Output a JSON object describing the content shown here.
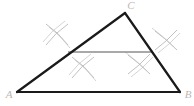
{
  "figure": {
    "canvas": {
      "width": 194,
      "height": 106,
      "background": "#ffffff"
    },
    "colors": {
      "triangle_stroke": "#1a1a1a",
      "midsegment_stroke": "#8c8c8c",
      "arc_stroke": "#b0b0b0",
      "label_fill": "#b9b9b9"
    },
    "stroke_widths": {
      "triangle": 2.2,
      "midsegment": 1.6,
      "arc": 0.8
    },
    "vertices": [
      {
        "name": "A",
        "label": "A",
        "x": 17,
        "y": 92,
        "label_x": 9,
        "label_y": 95
      },
      {
        "name": "B",
        "label": "B",
        "x": 180,
        "y": 92,
        "label_x": 188,
        "label_y": 95
      },
      {
        "name": "C",
        "label": "C",
        "x": 125,
        "y": 13,
        "label_x": 131,
        "label_y": 6
      }
    ],
    "sides": [
      {
        "name": "AB",
        "from": "A",
        "to": "B",
        "x1": 17,
        "y1": 92,
        "x2": 180,
        "y2": 92
      },
      {
        "name": "AC",
        "from": "A",
        "to": "C",
        "x1": 17,
        "y1": 92,
        "x2": 125,
        "y2": 13
      },
      {
        "name": "BC",
        "from": "B",
        "to": "C",
        "x1": 180,
        "y1": 92,
        "x2": 125,
        "y2": 13
      }
    ],
    "midsegment": {
      "name": "midsegment-MN",
      "x1": 68,
      "y1": 52,
      "x2": 152,
      "y2": 52,
      "description": "Horizontal segment joining the midpoint of AC to the midpoint of BC, parallel to AB"
    },
    "midpoints": [
      {
        "name": "M",
        "on_side": "AC",
        "x": 71,
        "y": 52
      },
      {
        "name": "N",
        "on_side": "BC",
        "x": 152,
        "y": 52
      }
    ],
    "arc_groups": [
      {
        "name": "arc-pair-upper-left",
        "side": "AC",
        "position": "above",
        "center_x": 57,
        "center_y": 35,
        "strokes": [
          {
            "x1": 46,
            "y1": 24,
            "x2": 68,
            "y2": 45,
            "curve": 4
          },
          {
            "x1": 68,
            "y1": 24,
            "x2": 46,
            "y2": 45,
            "curve": -4
          }
        ]
      },
      {
        "name": "arc-pair-lower-left",
        "side": "AC",
        "position": "below",
        "center_x": 83,
        "center_y": 68,
        "strokes": [
          {
            "x1": 72,
            "y1": 57,
            "x2": 94,
            "y2": 78,
            "curve": 4
          },
          {
            "x1": 94,
            "y1": 57,
            "x2": 72,
            "y2": 78,
            "curve": -4
          }
        ]
      },
      {
        "name": "arc-pair-upper-right",
        "side": "BC",
        "position": "above",
        "center_x": 166,
        "center_y": 40,
        "strokes": [
          {
            "x1": 155,
            "y1": 50,
            "x2": 177,
            "y2": 30,
            "curve": 4
          },
          {
            "x1": 155,
            "y1": 31,
            "x2": 177,
            "y2": 50,
            "curve": -4
          }
        ]
      },
      {
        "name": "arc-pair-lower-right",
        "side": "BC",
        "position": "below",
        "center_x": 139,
        "center_y": 64,
        "strokes": [
          {
            "x1": 128,
            "y1": 74,
            "x2": 150,
            "y2": 54,
            "curve": 4
          },
          {
            "x1": 128,
            "y1": 55,
            "x2": 150,
            "y2": 74,
            "curve": -4
          }
        ]
      }
    ]
  }
}
